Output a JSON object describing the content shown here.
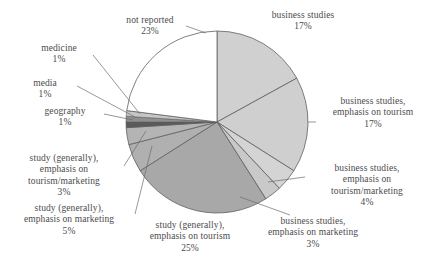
{
  "chart_data": {
    "type": "pie",
    "title": "",
    "subtitle": "",
    "xlabel": "",
    "ylabel": "",
    "legend_position": "none",
    "grid": false,
    "start_angle_deg": 0,
    "direction": "clockwise",
    "units": "percent",
    "total": 100,
    "categories": [
      "business studies",
      "business studies, emphasis on tourism",
      "business studies, emphasis on tourism/marketing",
      "business studies, emphasis on marketing",
      "study (generally), emphasis on tourism",
      "study (generally), emphasis on marketing",
      "study (generally), emphasis on tourism/marketing",
      "geography",
      "media",
      "medicine",
      "not reported"
    ],
    "values": [
      17,
      17,
      4,
      3,
      25,
      5,
      3,
      1,
      1,
      1,
      23
    ],
    "slices": [
      {
        "label_lines": [
          "business studies"
        ],
        "value_text": "17%",
        "value": 17,
        "color": "#d0d0d0",
        "label_id": "label-business-studies"
      },
      {
        "label_lines": [
          "business studies,",
          "emphasis on tourism"
        ],
        "value_text": "17%",
        "value": 17,
        "color": "#cfcfcf",
        "label_id": "label-bs-tourism"
      },
      {
        "label_lines": [
          "business studies,",
          "emphasis on",
          "tourism/marketing"
        ],
        "value_text": "4%",
        "value": 4,
        "color": "#d4d4d4",
        "label_id": "label-bs-tourism-marketing"
      },
      {
        "label_lines": [
          "business studies,",
          "emphasis on marketing"
        ],
        "value_text": "3%",
        "value": 3,
        "color": "#c9c9c9",
        "label_id": "label-bs-marketing"
      },
      {
        "label_lines": [
          "study (generally),",
          "emphasis on tourism"
        ],
        "value_text": "25%",
        "value": 25,
        "color": "#a8a8a8",
        "label_id": "label-study-tourism"
      },
      {
        "label_lines": [
          "study (generally),",
          "emphasis on marketing"
        ],
        "value_text": "5%",
        "value": 5,
        "color": "#b0b0b0",
        "label_id": "label-study-marketing"
      },
      {
        "label_lines": [
          "study (generally),",
          "emphasis on",
          "tourism/marketing"
        ],
        "value_text": "3%",
        "value": 3,
        "color": "#b4b4b4",
        "label_id": "label-study-tourism-marketing"
      },
      {
        "label_lines": [
          "geography"
        ],
        "value_text": "1%",
        "value": 1,
        "color": "#5a5a5a",
        "label_id": "label-geography"
      },
      {
        "label_lines": [
          "media"
        ],
        "value_text": "1%",
        "value": 1,
        "color": "#8f8f8f",
        "label_id": "label-media"
      },
      {
        "label_lines": [
          "medicine"
        ],
        "value_text": "1%",
        "value": 1,
        "color": "#c6c6c6",
        "label_id": "label-medicine"
      },
      {
        "label_lines": [
          "not reported"
        ],
        "value_text": "23%",
        "value": 23,
        "color": "#ffffff",
        "label_id": "label-not-reported"
      }
    ]
  },
  "labels": {
    "business_studies": {
      "line1": "business studies",
      "value": "17%"
    },
    "bs_tourism": {
      "line1": "business studies,",
      "line2": "emphasis on tourism",
      "value": "17%"
    },
    "bs_tourism_marketing": {
      "line1": "business studies,",
      "line2": "emphasis on",
      "line3": "tourism/marketing",
      "value": "4%"
    },
    "bs_marketing": {
      "line1": "business studies,",
      "line2": "emphasis on marketing",
      "value": "3%"
    },
    "study_tourism": {
      "line1": "study (generally),",
      "line2": "emphasis on tourism",
      "value": "25%"
    },
    "study_marketing": {
      "line1": "study (generally),",
      "line2": "emphasis on marketing",
      "value": "5%"
    },
    "study_tourism_marketing": {
      "line1": "study (generally),",
      "line2": "emphasis on",
      "line3": "tourism/marketing",
      "value": "3%"
    },
    "geography": {
      "line1": "geography",
      "value": "1%"
    },
    "media": {
      "line1": "media",
      "value": "1%"
    },
    "medicine": {
      "line1": "medicine",
      "value": "1%"
    },
    "not_reported": {
      "line1": "not reported",
      "value": "23%"
    }
  },
  "style": {
    "background": "#ffffff",
    "text_color": "#4b4b4b",
    "slice_outline": "#5f5f5f",
    "leader_line": "#6b6b6b"
  }
}
